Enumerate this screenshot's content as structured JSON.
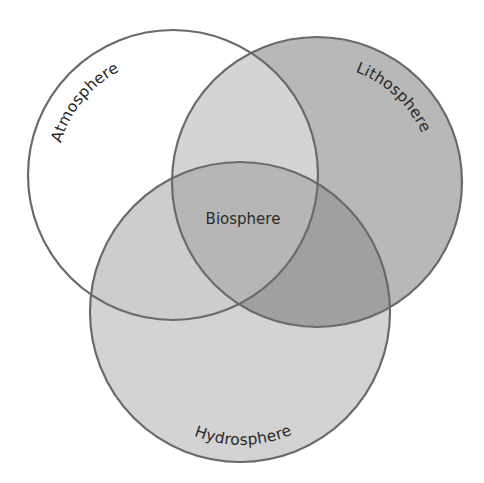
{
  "diagram": {
    "type": "venn",
    "sets": [
      {
        "id": "atmosphere",
        "label": "Atmosphere"
      },
      {
        "id": "lithosphere",
        "label": "Lithosphere"
      },
      {
        "id": "hydrosphere",
        "label": "Hydrosphere"
      }
    ],
    "intersection_label": "Biosphere",
    "colors": {
      "background": "#ffffff",
      "stroke": "#6a6a6a",
      "atmosphere_only": "#ffffff",
      "lithosphere_only": "#b8b8b8",
      "hydrosphere_only": "#d3d3d3",
      "atmosphere_lithosphere": "#d4d4d4",
      "atmosphere_hydrosphere": "#cdcdcd",
      "lithosphere_hydrosphere": "#a0a0a0",
      "all_three": "#b6b6b6",
      "text": "#2a2a2a"
    }
  }
}
